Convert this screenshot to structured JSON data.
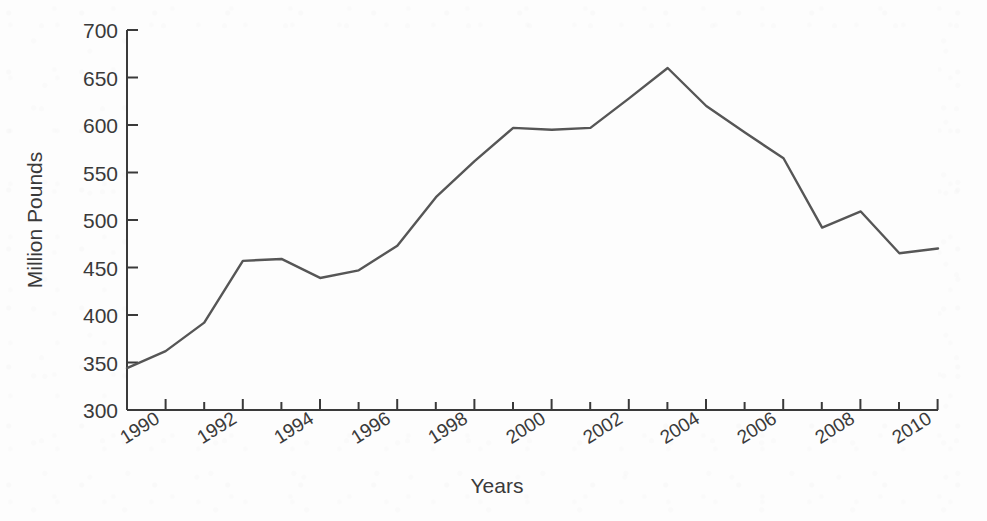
{
  "chart_data": {
    "type": "line",
    "title": "",
    "subtitle": "",
    "xlabel": "Years",
    "ylabel": "Million Pounds",
    "xlim": [
      1989,
      2010
    ],
    "ylim": [
      300,
      700
    ],
    "ytick_labels": [
      "300",
      "350",
      "400",
      "450",
      "500",
      "550",
      "600",
      "650",
      "700"
    ],
    "yticks": [
      300,
      350,
      400,
      450,
      500,
      550,
      600,
      650,
      700
    ],
    "xtick_labels": [
      "1990",
      "1992",
      "1994",
      "1996",
      "1998",
      "2000",
      "2002",
      "2004",
      "2006",
      "2008",
      "2010"
    ],
    "xticks": [
      1990,
      1992,
      1994,
      1996,
      1998,
      2000,
      2002,
      2004,
      2006,
      2008,
      2010
    ],
    "xtick_minor": [
      1991,
      1993,
      1995,
      1997,
      1999,
      2001,
      2003,
      2005,
      2007,
      2009
    ],
    "grid": false,
    "legend": false,
    "legend_position": "none",
    "line_color": "#565656",
    "line_width": 2.4,
    "background_color": "#fdfdfd",
    "axis_color": "#3a3a3a",
    "x": [
      1989,
      1990,
      1991,
      1992,
      1993,
      1994,
      1995,
      1996,
      1997,
      1998,
      1999,
      2000,
      2001,
      2002,
      2003,
      2004,
      2005,
      2006,
      2007,
      2008,
      2009,
      2010
    ],
    "series": [
      {
        "name": "Million Pounds",
        "values": [
          344,
          362,
          392,
          457,
          459,
          439,
          447,
          473,
          524,
          562,
          597,
          595,
          597,
          628,
          660,
          620,
          592,
          565,
          492,
          509,
          465,
          470
        ]
      }
    ]
  },
  "axis": {
    "y_title": "Million Pounds",
    "x_title": "Years"
  }
}
